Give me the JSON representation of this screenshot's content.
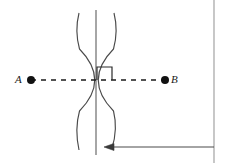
{
  "figure": {
    "type": "geometric-construction",
    "width": 226,
    "height": 163,
    "background_color": "#ffffff",
    "stroke_color": "#3a3a3a",
    "dark_stroke_color": "#1a1a1a",
    "border_color": "#9a9a9a"
  },
  "points": [
    {
      "id": "A",
      "label": "A",
      "label_x": 15,
      "label_y": 74,
      "dot_x": 31,
      "dot_y": 80,
      "dot_radius": 4
    },
    {
      "id": "B",
      "label": "B",
      "label_x": 171,
      "label_y": 74,
      "dot_x": 165,
      "dot_y": 80,
      "dot_radius": 4
    }
  ],
  "segment_ab": {
    "name": "dashed-segment-ab",
    "x1": 31,
    "y1": 80,
    "x2": 165,
    "y2": 80,
    "style": "dashed",
    "dash_pattern": "5 5"
  },
  "perpendicular_bisector": {
    "name": "vertical-bisector-line",
    "x": 96,
    "y_top": 10,
    "y_bottom": 155
  },
  "arcs": [
    {
      "name": "arc-from-a",
      "center_hint": "A",
      "path": "M 79 13 Q 74 31 79 49 Q 110 80 79 111 Q 74 129 79 150"
    },
    {
      "name": "arc-from-b",
      "center_hint": "B",
      "path": "M 114 13 Q 119 31 114 49 Q 83 80 114 111 Q 118 129 112 148"
    }
  ],
  "intersections": [
    {
      "name": "upper-arc-intersection",
      "x": 96,
      "y": 31
    },
    {
      "name": "lower-arc-intersection",
      "x": 96,
      "y": 131
    }
  ],
  "right_angle_marker": {
    "name": "right-angle-square",
    "x": 97,
    "y": 67,
    "width": 15,
    "height": 13
  },
  "arrow_annotation": {
    "name": "bisector-pointer-arrow",
    "x_tail": 214,
    "x_tip": 104,
    "y": 147,
    "direction": "left",
    "head_length": 9,
    "head_half_width": 3.5
  },
  "page_border": {
    "name": "page-right-margin-rule",
    "x": 214,
    "y_top": 0,
    "y_bottom": 163
  }
}
